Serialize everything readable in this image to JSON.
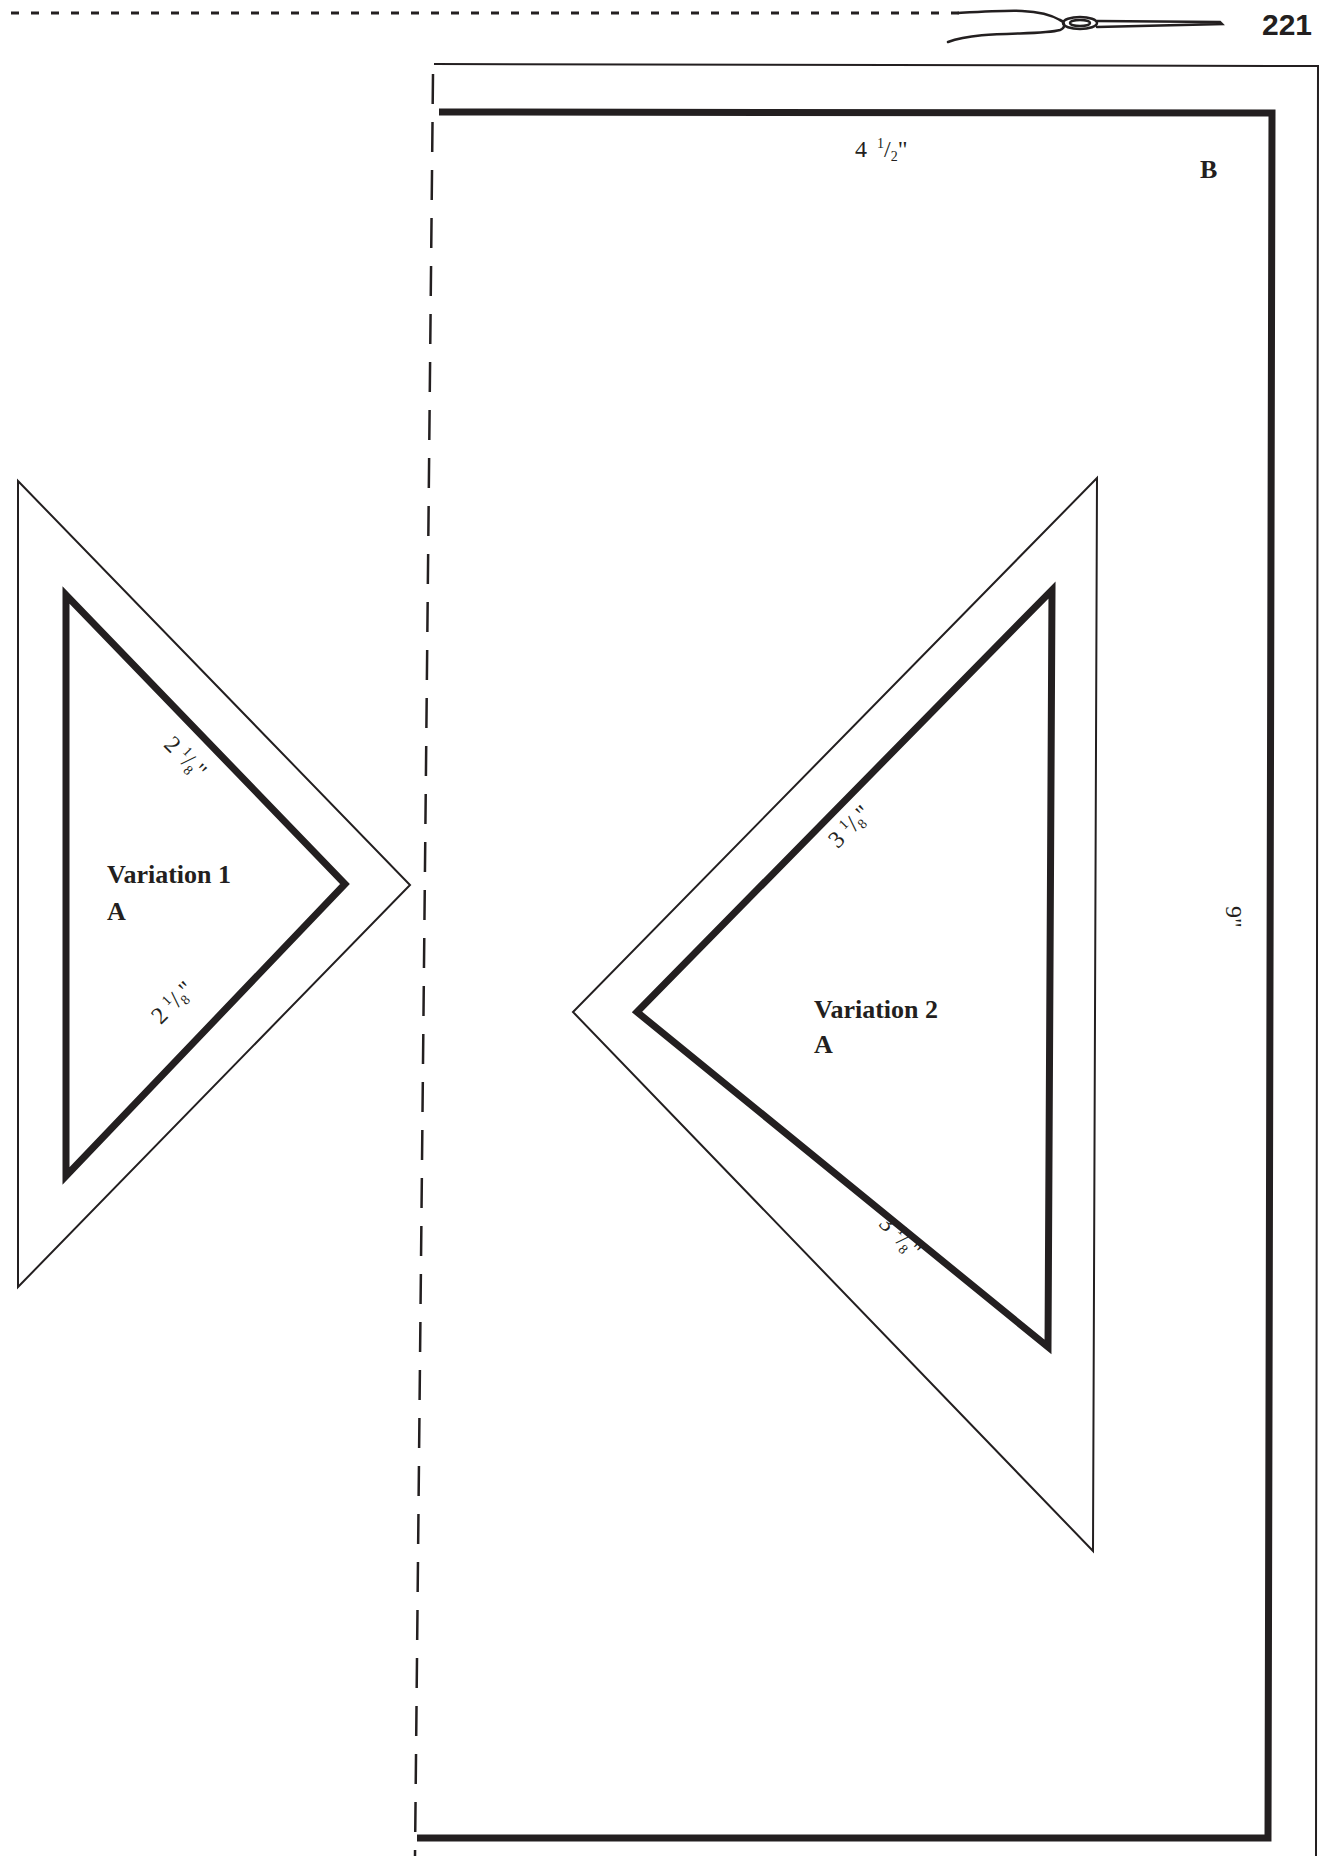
{
  "page": {
    "number": "221",
    "header_icon": "needle-thread-icon",
    "ink_color": "#231f20",
    "background": "#ffffff"
  },
  "template_b": {
    "label": "B",
    "width_label": {
      "whole": "4",
      "num": "1",
      "den": "2",
      "unit": "\""
    },
    "height_label": "9\""
  },
  "variation_1": {
    "title": "Variation 1",
    "piece": "A",
    "edge_labels": [
      {
        "whole": "2",
        "num": "1",
        "den": "8",
        "unit": "\""
      },
      {
        "whole": "2",
        "num": "1",
        "den": "8",
        "unit": "\""
      }
    ]
  },
  "variation_2": {
    "title": "Variation 2",
    "piece": "A",
    "edge_labels": [
      {
        "whole": "3",
        "num": "1",
        "den": "8",
        "unit": "\""
      },
      {
        "whole": "3",
        "num": "1",
        "den": "8",
        "unit": "\""
      }
    ]
  }
}
